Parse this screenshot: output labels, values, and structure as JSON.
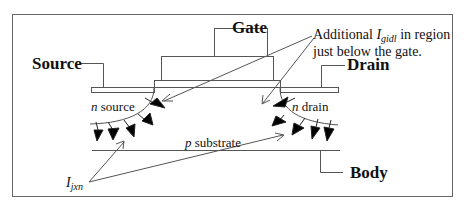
{
  "diagram": {
    "type": "MOSFET cross-section leakage diagram",
    "labels": {
      "gate": "Gate",
      "source": "Source",
      "drain": "Drain",
      "body": "Body",
      "n_source_prefix": "n",
      "n_source_suffix": " source",
      "n_drain_prefix": "n",
      "n_drain_suffix": " drain",
      "p_substrate_prefix": "p",
      "p_substrate_suffix": " substrate",
      "gidl_line1_prefix": "Additional ",
      "gidl_symbol": "I",
      "gidl_subscript": "gidl",
      "gidl_line1_suffix": " in region",
      "gidl_line2": "just below the gate.",
      "ijxn_symbol": "I",
      "ijxn_subscript": "jxn"
    },
    "colors": {
      "stroke": "#555555",
      "text": "#111111",
      "arrow_fill": "#000000"
    }
  }
}
